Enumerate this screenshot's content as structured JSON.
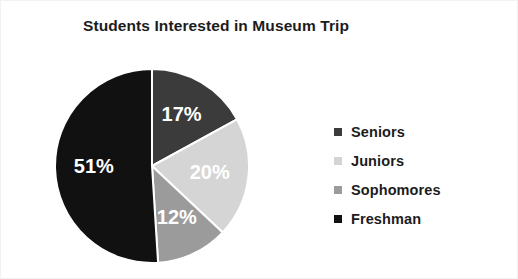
{
  "chart_data": {
    "type": "pie",
    "title": "Students Interested in Museum Trip",
    "categories": [
      "Seniors",
      "Juniors",
      "Sophomores",
      "Freshman"
    ],
    "values": [
      17,
      20,
      12,
      51
    ],
    "value_labels": [
      "17%",
      "20%",
      "12%",
      "51%"
    ],
    "unit": "percent",
    "total": 100,
    "colors": [
      "#3b3b3b",
      "#d5d5d5",
      "#9b9b9b",
      "#111111"
    ],
    "legend_position": "right",
    "grid": false,
    "start_angle_deg": 0,
    "direction": "clockwise",
    "label_color": "#ffffff",
    "background": "#ffffff"
  },
  "chart": {
    "title": "Students Interested in Museum Trip",
    "slices": [
      {
        "label": "Seniors",
        "percent_text": "17%",
        "value": 17,
        "color": "#3b3b3b"
      },
      {
        "label": "Juniors",
        "percent_text": "20%",
        "value": 20,
        "color": "#d5d5d5"
      },
      {
        "label": "Sophomores",
        "percent_text": "12%",
        "value": 12,
        "color": "#9b9b9b"
      },
      {
        "label": "Freshman",
        "percent_text": "51%",
        "value": 51,
        "color": "#111111"
      }
    ]
  },
  "legend": {
    "items": [
      {
        "label": "Seniors",
        "color": "#3b3b3b"
      },
      {
        "label": "Juniors",
        "color": "#d5d5d5"
      },
      {
        "label": "Sophomores",
        "color": "#9b9b9b"
      },
      {
        "label": "Freshman",
        "color": "#111111"
      }
    ]
  }
}
